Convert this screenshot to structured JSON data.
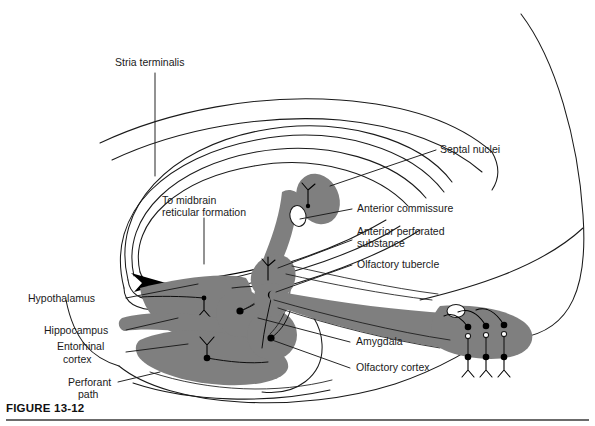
{
  "figure": {
    "caption": "FIGURE  13-12",
    "domain": "anatomical-diagram",
    "colors": {
      "gray_fill": "#7f7f7f",
      "outline": "#1a1a1a",
      "soma": "#000000",
      "background": "#ffffff"
    }
  },
  "labels": {
    "stria_terminalis": "Stria terminalis",
    "to_midbrain_line1": "To midbrain",
    "to_midbrain_line2": "reticular formation",
    "septal_nuclei": "Septal nuclei",
    "anterior_commissure": "Anterior commissure",
    "anterior_perforated_line1": "Anterior perforated",
    "anterior_perforated_line2": "substance",
    "olfactory_tubercle": "Olfactory tubercle",
    "hypothalamus": "Hypothalamus",
    "hippocampus": "Hippocampus",
    "entorhinal_line1": "Entorhinal",
    "entorhinal_line2": "cortex",
    "perforant_line1": "Perforant",
    "perforant_line2": "path",
    "amygdala": "Amygdala",
    "olfactory_cortex": "Olfactory cortex"
  },
  "structures": [
    {
      "name": "septal-nuclei",
      "shaded": true
    },
    {
      "name": "anterior-commissure",
      "shaded": true
    },
    {
      "name": "anterior-perforated-substance",
      "shaded": true
    },
    {
      "name": "olfactory-tubercle",
      "shaded": true
    },
    {
      "name": "olfactory-tract",
      "shaded": true
    },
    {
      "name": "olfactory-cortex",
      "shaded": true
    },
    {
      "name": "amygdala",
      "shaded": true
    },
    {
      "name": "hypothalamus",
      "shaded": true
    },
    {
      "name": "hippocampus",
      "shaded": true
    },
    {
      "name": "entorhinal-cortex",
      "shaded": true
    },
    {
      "name": "fornix",
      "shaded": false
    },
    {
      "name": "stria-terminalis",
      "shaded": false
    }
  ]
}
